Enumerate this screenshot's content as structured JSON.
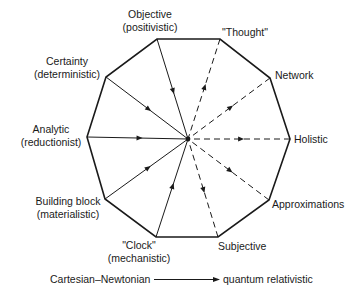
{
  "center": {
    "x": 188,
    "y": 139
  },
  "colors": {
    "ink": "#1a1a1a",
    "background": "#ffffff"
  },
  "vertices": [
    {
      "id": "objective",
      "x": 157,
      "y": 39,
      "label_lines": [
        "Objective",
        "(positivistic)"
      ],
      "label_x": 150,
      "label_y": 18,
      "anchor": "middle",
      "side": "cartesian"
    },
    {
      "id": "thought",
      "x": 220,
      "y": 39,
      "label_lines": [
        "\"Thought\""
      ],
      "label_x": 245,
      "label_y": 36,
      "anchor": "middle",
      "side": "quantum"
    },
    {
      "id": "network",
      "x": 270,
      "y": 78,
      "label_lines": [
        "Network"
      ],
      "label_x": 275,
      "label_y": 79,
      "anchor": "start",
      "side": "quantum"
    },
    {
      "id": "holistic",
      "x": 290,
      "y": 139,
      "label_lines": [
        "Holistic"
      ],
      "label_x": 294,
      "label_y": 143,
      "anchor": "start",
      "side": "quantum"
    },
    {
      "id": "approximations",
      "x": 269,
      "y": 200,
      "label_lines": [
        "Approximations"
      ],
      "label_x": 272,
      "label_y": 208,
      "anchor": "start",
      "side": "quantum"
    },
    {
      "id": "subjective",
      "x": 218,
      "y": 237,
      "label_lines": [
        "Subjective"
      ],
      "label_x": 218,
      "label_y": 250,
      "anchor": "start",
      "side": "quantum"
    },
    {
      "id": "clock",
      "x": 156,
      "y": 237,
      "label_lines": [
        "\"Clock\"",
        "(mechanistic)"
      ],
      "label_x": 139,
      "label_y": 249,
      "anchor": "middle",
      "side": "cartesian"
    },
    {
      "id": "building_block",
      "x": 105,
      "y": 199,
      "label_lines": [
        "Building block",
        "(materialistic)"
      ],
      "label_x": 68,
      "label_y": 205,
      "anchor": "middle",
      "side": "cartesian"
    },
    {
      "id": "analytic",
      "x": 87,
      "y": 137,
      "label_lines": [
        "Analytic",
        "(reductionist)"
      ],
      "label_x": 51,
      "label_y": 133,
      "anchor": "middle",
      "side": "cartesian"
    },
    {
      "id": "certainty",
      "x": 106,
      "y": 77,
      "label_lines": [
        "Certainty",
        "(deterministic)"
      ],
      "label_x": 67,
      "label_y": 65,
      "anchor": "middle",
      "side": "cartesian"
    }
  ],
  "legend": {
    "from_label": "Cartesian–Newtonian",
    "to_label": "quantum relativistic",
    "from_x": 50,
    "y": 283,
    "arrow_x1": 154,
    "arrow_x2": 220,
    "to_x": 223
  }
}
